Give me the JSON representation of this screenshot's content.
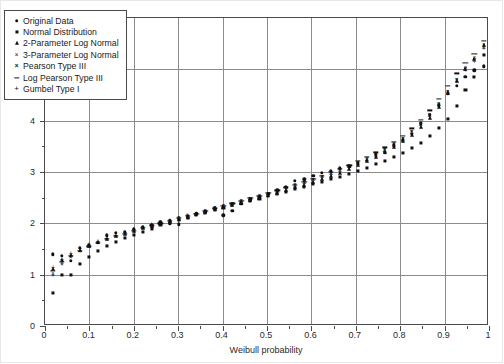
{
  "chart_data": {
    "type": "scatter",
    "title": "",
    "xlabel": "Weibull probability",
    "ylabel": "Volume (in.)",
    "xlim": [
      0,
      1
    ],
    "ylim": [
      0,
      6
    ],
    "xticks": [
      "0",
      "0.1",
      "0.2",
      "0.3",
      "0.4",
      "0.5",
      "0.6",
      "0.7",
      "0.8",
      "0.9",
      "1"
    ],
    "xtick_values": [
      0,
      0.1,
      0.2,
      0.3,
      0.4,
      0.5,
      0.6,
      0.7,
      0.8,
      0.9,
      1
    ],
    "yticks": [
      "0",
      "1",
      "2",
      "3",
      "4",
      "5",
      "6"
    ],
    "ytick_values": [
      0,
      1,
      2,
      3,
      4,
      5,
      6
    ],
    "grid": true,
    "legend_position": "upper-left",
    "series": [
      {
        "name": "Original Data",
        "marker": "circle",
        "x": [
          0.018,
          0.038,
          0.058,
          0.079,
          0.099,
          0.119,
          0.139,
          0.159,
          0.18,
          0.2,
          0.22,
          0.24,
          0.26,
          0.281,
          0.301,
          0.321,
          0.341,
          0.361,
          0.382,
          0.402,
          0.422,
          0.442,
          0.462,
          0.483,
          0.503,
          0.523,
          0.543,
          0.563,
          0.584,
          0.604,
          0.624,
          0.644,
          0.664,
          0.685,
          0.705,
          0.725,
          0.745,
          0.765,
          0.786,
          0.806,
          0.826,
          0.846,
          0.866,
          0.887,
          0.907,
          0.927,
          0.947,
          0.967,
          0.988
        ],
        "y": [
          1.4,
          1.37,
          1.27,
          1.52,
          1.58,
          1.62,
          1.77,
          1.81,
          1.84,
          1.88,
          1.92,
          1.97,
          2.02,
          2.0,
          1.98,
          2.12,
          2.18,
          2.22,
          2.3,
          2.16,
          2.24,
          2.38,
          2.47,
          2.52,
          2.57,
          2.64,
          2.71,
          2.83,
          2.86,
          2.93,
          2.98,
          3.02,
          3.07,
          3.1,
          3.18,
          3.22,
          3.33,
          3.38,
          3.52,
          3.62,
          3.75,
          3.95,
          4.12,
          4.3,
          4.52,
          4.68,
          4.86,
          4.98,
          5.06
        ]
      },
      {
        "name": "Normal Distribution",
        "marker": "square",
        "x": [
          0.018,
          0.038,
          0.058,
          0.079,
          0.099,
          0.119,
          0.139,
          0.159,
          0.18,
          0.2,
          0.22,
          0.24,
          0.26,
          0.281,
          0.301,
          0.321,
          0.341,
          0.361,
          0.382,
          0.402,
          0.422,
          0.442,
          0.462,
          0.483,
          0.503,
          0.523,
          0.543,
          0.563,
          0.584,
          0.604,
          0.624,
          0.644,
          0.664,
          0.685,
          0.705,
          0.725,
          0.745,
          0.765,
          0.786,
          0.806,
          0.826,
          0.846,
          0.866,
          0.887,
          0.907,
          0.927,
          0.947,
          0.967,
          0.988
        ],
        "y": [
          0.65,
          0.99,
          1.0,
          1.21,
          1.35,
          1.47,
          1.56,
          1.64,
          1.71,
          1.78,
          1.84,
          1.9,
          1.96,
          2.01,
          2.06,
          2.11,
          2.16,
          2.21,
          2.26,
          2.3,
          2.35,
          2.39,
          2.44,
          2.48,
          2.53,
          2.57,
          2.62,
          2.67,
          2.71,
          2.76,
          2.81,
          2.86,
          2.91,
          2.97,
          3.02,
          3.08,
          3.15,
          3.22,
          3.29,
          3.37,
          3.47,
          3.57,
          3.7,
          3.85,
          4.04,
          4.29,
          4.59,
          4.86,
          5.28
        ]
      },
      {
        "name": "2-Parameter Log Normal",
        "marker": "triangle",
        "x": [
          0.018,
          0.038,
          0.058,
          0.079,
          0.099,
          0.119,
          0.139,
          0.159,
          0.18,
          0.2,
          0.22,
          0.24,
          0.26,
          0.281,
          0.301,
          0.321,
          0.341,
          0.361,
          0.382,
          0.402,
          0.422,
          0.442,
          0.462,
          0.483,
          0.503,
          0.523,
          0.543,
          0.563,
          0.584,
          0.604,
          0.624,
          0.644,
          0.664,
          0.685,
          0.705,
          0.725,
          0.745,
          0.765,
          0.786,
          0.806,
          0.826,
          0.846,
          0.866,
          0.887,
          0.907,
          0.927,
          0.947,
          0.967,
          0.988
        ],
        "y": [
          1.12,
          1.28,
          1.39,
          1.48,
          1.56,
          1.63,
          1.69,
          1.75,
          1.8,
          1.85,
          1.9,
          1.95,
          2.0,
          2.04,
          2.09,
          2.13,
          2.18,
          2.22,
          2.27,
          2.31,
          2.36,
          2.4,
          2.45,
          2.5,
          2.55,
          2.6,
          2.65,
          2.7,
          2.75,
          2.81,
          2.87,
          2.93,
          2.99,
          3.06,
          3.13,
          3.21,
          3.29,
          3.39,
          3.49,
          3.6,
          3.73,
          3.88,
          4.06,
          4.27,
          4.53,
          4.77,
          5.0,
          5.2,
          5.48
        ]
      },
      {
        "name": "3-Parameter Log Normal",
        "marker": "x",
        "x": [
          0.018,
          0.038,
          0.058,
          0.079,
          0.099,
          0.119,
          0.139,
          0.159,
          0.18,
          0.2,
          0.22,
          0.24,
          0.26,
          0.281,
          0.301,
          0.321,
          0.341,
          0.361,
          0.382,
          0.402,
          0.422,
          0.442,
          0.462,
          0.483,
          0.503,
          0.523,
          0.543,
          0.563,
          0.584,
          0.604,
          0.624,
          0.644,
          0.664,
          0.685,
          0.705,
          0.725,
          0.745,
          0.765,
          0.786,
          0.806,
          0.826,
          0.846,
          0.866,
          0.887,
          0.907,
          0.927,
          0.947,
          0.967,
          0.988
        ],
        "y": [
          1.02,
          1.22,
          1.35,
          1.45,
          1.54,
          1.61,
          1.68,
          1.74,
          1.79,
          1.85,
          1.9,
          1.95,
          1.99,
          2.04,
          2.09,
          2.13,
          2.18,
          2.23,
          2.27,
          2.32,
          2.37,
          2.42,
          2.47,
          2.52,
          2.57,
          2.62,
          2.67,
          2.72,
          2.78,
          2.84,
          2.9,
          2.96,
          3.02,
          3.09,
          3.16,
          3.24,
          3.33,
          3.42,
          3.52,
          3.64,
          3.77,
          3.92,
          4.1,
          4.31,
          4.56,
          4.8,
          5.02,
          5.22,
          5.47
        ]
      },
      {
        "name": "Pearson Type III",
        "marker": "x-bold",
        "x": [
          0.018,
          0.038,
          0.058,
          0.079,
          0.099,
          0.119,
          0.139,
          0.159,
          0.18,
          0.2,
          0.22,
          0.24,
          0.26,
          0.281,
          0.301,
          0.321,
          0.341,
          0.361,
          0.382,
          0.402,
          0.422,
          0.442,
          0.462,
          0.483,
          0.503,
          0.523,
          0.543,
          0.563,
          0.584,
          0.604,
          0.624,
          0.644,
          0.664,
          0.685,
          0.705,
          0.725,
          0.745,
          0.765,
          0.786,
          0.806,
          0.826,
          0.846,
          0.866,
          0.887,
          0.907,
          0.927,
          0.947,
          0.967,
          0.988
        ],
        "y": [
          0.98,
          1.19,
          1.33,
          1.44,
          1.53,
          1.61,
          1.68,
          1.74,
          1.8,
          1.85,
          1.9,
          1.95,
          2.0,
          2.05,
          2.1,
          2.14,
          2.19,
          2.24,
          2.29,
          2.33,
          2.38,
          2.43,
          2.48,
          2.53,
          2.58,
          2.63,
          2.68,
          2.74,
          2.79,
          2.85,
          2.91,
          2.97,
          3.04,
          3.11,
          3.18,
          3.26,
          3.34,
          3.43,
          3.54,
          3.65,
          3.78,
          3.93,
          4.11,
          4.32,
          4.56,
          4.79,
          5.0,
          5.18,
          5.42
        ]
      },
      {
        "name": "Log Pearson Type III",
        "marker": "dash",
        "x": [
          0.018,
          0.038,
          0.058,
          0.079,
          0.099,
          0.119,
          0.139,
          0.159,
          0.18,
          0.2,
          0.22,
          0.24,
          0.26,
          0.281,
          0.301,
          0.321,
          0.341,
          0.361,
          0.382,
          0.402,
          0.422,
          0.442,
          0.462,
          0.483,
          0.503,
          0.523,
          0.543,
          0.563,
          0.584,
          0.604,
          0.624,
          0.644,
          0.664,
          0.685,
          0.705,
          0.725,
          0.745,
          0.765,
          0.786,
          0.806,
          0.826,
          0.846,
          0.866,
          0.887,
          0.907,
          0.927,
          0.947,
          0.967,
          0.988
        ],
        "y": [
          1.08,
          1.25,
          1.37,
          1.47,
          1.55,
          1.62,
          1.69,
          1.75,
          1.8,
          1.86,
          1.91,
          1.96,
          2.0,
          2.05,
          2.1,
          2.15,
          2.19,
          2.24,
          2.29,
          2.34,
          2.39,
          2.44,
          2.49,
          2.54,
          2.59,
          2.64,
          2.7,
          2.75,
          2.81,
          2.87,
          2.93,
          3.0,
          3.06,
          3.13,
          3.21,
          3.29,
          3.38,
          3.48,
          3.59,
          3.71,
          3.85,
          4.01,
          4.2,
          4.42,
          4.68,
          4.92,
          5.13,
          5.3,
          5.56
        ]
      },
      {
        "name": "Gumbel Type I",
        "marker": "plus",
        "x": [
          0.018,
          0.038,
          0.058,
          0.079,
          0.099,
          0.119,
          0.139,
          0.159,
          0.18,
          0.2,
          0.22,
          0.24,
          0.26,
          0.281,
          0.301,
          0.321,
          0.341,
          0.361,
          0.382,
          0.402,
          0.422,
          0.442,
          0.462,
          0.483,
          0.503,
          0.523,
          0.543,
          0.563,
          0.584,
          0.604,
          0.624,
          0.644,
          0.664,
          0.685,
          0.705,
          0.725,
          0.745,
          0.765,
          0.786,
          0.806,
          0.826,
          0.846,
          0.866,
          0.887,
          0.907,
          0.927,
          0.947,
          0.967,
          0.988
        ],
        "y": [
          1.15,
          1.3,
          1.42,
          1.51,
          1.59,
          1.66,
          1.72,
          1.78,
          1.83,
          1.88,
          1.93,
          1.98,
          2.02,
          2.07,
          2.11,
          2.16,
          2.2,
          2.25,
          2.29,
          2.34,
          2.38,
          2.43,
          2.48,
          2.53,
          2.57,
          2.62,
          2.68,
          2.73,
          2.78,
          2.84,
          2.9,
          2.96,
          3.02,
          3.09,
          3.16,
          3.24,
          3.32,
          3.41,
          3.51,
          3.63,
          3.76,
          3.91,
          4.09,
          4.3,
          4.55,
          4.78,
          4.99,
          5.17,
          5.41
        ]
      }
    ]
  },
  "legend": {
    "items": [
      {
        "label": "Original Data",
        "marker": "circle"
      },
      {
        "label": "Normal Distribution",
        "marker": "square"
      },
      {
        "label": "2-Parameter Log Normal",
        "marker": "triangle"
      },
      {
        "label": "3-Parameter Log Normal",
        "marker": "x"
      },
      {
        "label": "Pearson Type III",
        "marker": "x-bold"
      },
      {
        "label": "Log Pearson Type III",
        "marker": "dash"
      },
      {
        "label": "Gumbel Type I",
        "marker": "plus"
      }
    ]
  },
  "colors": {
    "marker": "#111111",
    "axis": "#4a4a4a",
    "grid": "#8c8c8c",
    "background": "#ffffff"
  }
}
